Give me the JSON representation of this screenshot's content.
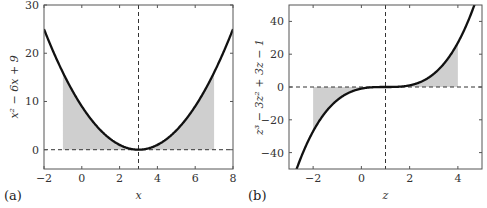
{
  "chart_data": [
    {
      "type": "line",
      "panel_label": "(a)",
      "title": "",
      "xlabel": "x",
      "ylabel": "x² − 6x + 9",
      "function": "x^2 - 6x + 9",
      "xlim": [
        -2,
        8
      ],
      "ylim": [
        -4,
        30
      ],
      "xticks": [
        -2,
        0,
        2,
        4,
        6,
        8
      ],
      "yticks": [
        0,
        10,
        20,
        30
      ],
      "shaded_interval": [
        -1,
        7
      ],
      "vline": 3,
      "hline": 0,
      "x": [
        -2,
        -1,
        0,
        1,
        2,
        3,
        4,
        5,
        6,
        7,
        8
      ],
      "y": [
        25,
        16,
        9,
        4,
        1,
        0,
        1,
        4,
        9,
        16,
        25
      ],
      "grid": false
    },
    {
      "type": "line",
      "panel_label": "(b)",
      "title": "",
      "xlabel": "z",
      "ylabel": "z³ − 3z² + 3z − 1",
      "function": "z^3 - 3z^2 + 3z - 1",
      "xlim": [
        -3,
        5
      ],
      "ylim": [
        -50,
        50
      ],
      "xticks": [
        -2,
        0,
        2,
        4
      ],
      "yticks": [
        -40,
        -20,
        0,
        20,
        40
      ],
      "shaded_interval": [
        -2,
        4
      ],
      "vline": 1,
      "hline": 0,
      "x": [
        -2.7,
        -2,
        -1,
        0,
        1,
        2,
        3,
        4,
        4.7
      ],
      "y": [
        -50.65,
        -27,
        -8,
        -1,
        0,
        1,
        8,
        27,
        50.65
      ],
      "grid": false
    }
  ]
}
